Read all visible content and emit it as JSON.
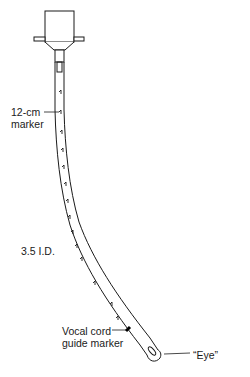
{
  "diagram": {
    "labels": {
      "marker_12cm": [
        "12-cm",
        "marker"
      ],
      "inner_diameter": "3.5 I.D.",
      "vocal_cord_marker": [
        "Vocal cord",
        "guide marker"
      ],
      "eye": "“Eye”"
    },
    "parts": [
      "connector",
      "tube",
      "depth-markers",
      "vocal-cord-guide-marker",
      "murphy-eye"
    ],
    "colors": {
      "stroke": "#1a1a1a",
      "background": "#ffffff"
    }
  }
}
